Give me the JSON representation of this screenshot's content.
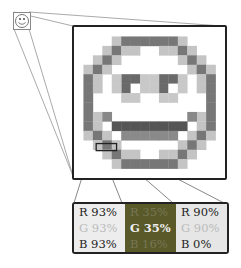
{
  "figure": {
    "icons": {
      "thumbnail": "smiley-face-icon",
      "magnified": "smiley-face-pixel-grid"
    },
    "swatches": [
      {
        "bg": "#ededed",
        "r": "R 93%",
        "g": "G 93%",
        "b": "B 93%",
        "r_color": "#222",
        "g_color": "#bbbbbb",
        "b_color": "#222"
      },
      {
        "bg": "#595929",
        "r": "R 35%",
        "g": "G 35%",
        "b": "B 16%",
        "r_color": "#777755",
        "g_color": "#f0f0f0",
        "b_color": "#777755"
      },
      {
        "bg": "#e6e6e6",
        "r": "R 90%",
        "g": "G 90%",
        "b": "B  0%",
        "r_color": "#222",
        "g_color": "#bbbbbb",
        "b_color": "#222"
      }
    ]
  }
}
